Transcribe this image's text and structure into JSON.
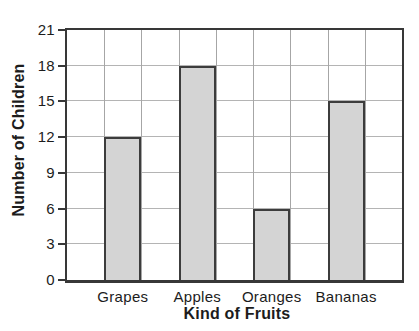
{
  "chart_data": {
    "type": "bar",
    "categories": [
      "Grapes",
      "Apples",
      "Oranges",
      "Bananas"
    ],
    "values": [
      12,
      18,
      6,
      15
    ],
    "xlabel": "Kind of Fruits",
    "ylabel": "Number of Children",
    "ylim": [
      0,
      21
    ],
    "ytick_step": 3,
    "yticks": [
      21,
      18,
      15,
      12,
      9,
      6,
      3,
      0
    ],
    "grid": "both",
    "legend": "none",
    "colors": {
      "background": "#ffffff",
      "bar_fill": "#d4d4d4",
      "bar_border": "#3c3c3c",
      "grid_horizontal": "#b4b4b4",
      "grid_vertical": "#a6a6a6",
      "axis": "#383838",
      "text": "#1c1c1c"
    }
  }
}
